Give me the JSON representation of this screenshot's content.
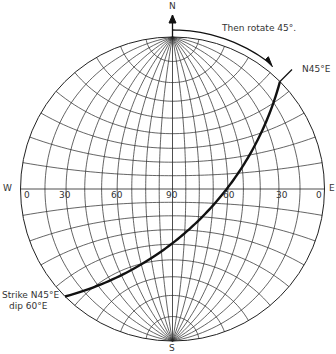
{
  "diagram": {
    "type": "stereonet",
    "compass": {
      "north": "N",
      "south": "S",
      "west": "W",
      "east": "E"
    },
    "equator_ticks": [
      "0",
      "30",
      "60",
      "90",
      "60",
      "30",
      "0"
    ],
    "annotations": {
      "rotate": "Then rotate 45°.",
      "strike_direction": "N45°E",
      "plane": {
        "line1": "Strike N45°E",
        "line2": "dip 60°E"
      }
    },
    "great_circle_dip_deg": 60,
    "grid_interval_deg": 10,
    "colors": {
      "grid": "#222222",
      "great_circle": "#111111",
      "text": "#333333"
    }
  }
}
